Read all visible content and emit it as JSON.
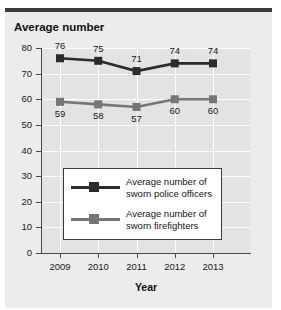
{
  "chart_data": {
    "type": "line",
    "title": "Average number",
    "xlabel": "Year",
    "ylabel": "",
    "categories": [
      "2009",
      "2010",
      "2011",
      "2012",
      "2013"
    ],
    "x": [
      2009,
      2010,
      2011,
      2012,
      2013
    ],
    "ylim": [
      0,
      80
    ],
    "yticks": [
      0,
      10,
      20,
      30,
      40,
      50,
      60,
      70,
      80
    ],
    "ytick_labels": [
      "0",
      "10",
      "20",
      "30",
      "40",
      "50",
      "60",
      "70",
      "80"
    ],
    "grid": true,
    "legend_position": "center",
    "series": [
      {
        "name": "Average number of sworn police officers",
        "name_line1": "Average number of",
        "name_line2": "sworn police officers",
        "color": "#2b2b2b",
        "marker": "square",
        "values": [
          76,
          75,
          71,
          74,
          74
        ],
        "labels": [
          "76",
          "75",
          "71",
          "74",
          "74"
        ],
        "label_position": "above"
      },
      {
        "name": "Average number of sworn firefighters",
        "name_line1": "Average number of",
        "name_line2": "sworn firefighters",
        "color": "#767676",
        "marker": "square",
        "values": [
          59,
          58,
          57,
          60,
          60
        ],
        "labels": [
          "59",
          "58",
          "57",
          "60",
          "60"
        ],
        "label_position": "below"
      }
    ]
  },
  "colors": {
    "panel_background": "#ececec",
    "plot_background": "#e3e3e3",
    "gridline": "#ffffff",
    "axis": "#4a4a4a",
    "top_rule": "#3b3b3b",
    "text": "#1a1a1a",
    "legend_background": "#ffffff",
    "legend_border": "#3c3c3c"
  }
}
